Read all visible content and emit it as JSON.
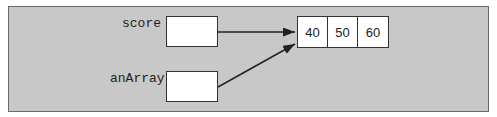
{
  "diagram": {
    "variables": [
      {
        "name": "score"
      },
      {
        "name": "anArray"
      }
    ],
    "array": {
      "values": [
        "40",
        "50",
        "60"
      ]
    },
    "colors": {
      "panel": "#c8c8c8",
      "border": "#333333"
    }
  }
}
